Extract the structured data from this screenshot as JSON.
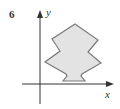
{
  "figure": {
    "number": "6",
    "x_axis_label": "x",
    "y_axis_label": "y",
    "shape_fill": "#e3e3e3",
    "shape_stroke": "#7a7a7a",
    "axis_color": "#333333",
    "shape_points": "75,24 98,40 88,52 101,63 82,74 81,76 85,81 63,81 67,76 66,74 45,62 60,51 52,39"
  }
}
